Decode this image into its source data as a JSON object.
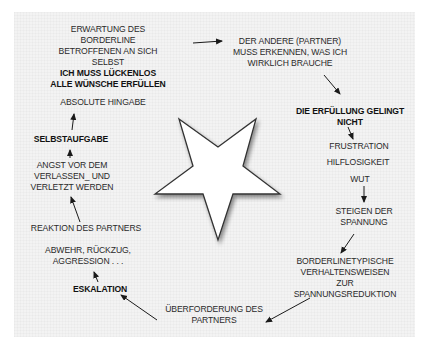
{
  "diagram": {
    "type": "cycle",
    "center_shape": "inverted-star",
    "colors": {
      "background": "#f3f3f3",
      "text": "#2a2a2a",
      "star_fill": "#ffffff",
      "star_stroke": "#333333"
    },
    "nodes": {
      "expectation": {
        "lines": [
          "ERWARTUNG DES",
          "BORDERLINE",
          "BETROFFENEN AN SICH",
          "SELBST"
        ],
        "bold_lines": [
          "ICH MUSS LÜCKENLOS",
          "ALLE WÜNSCHE ERFÜLLEN"
        ]
      },
      "hingabe": {
        "text": "ABSOLUTE HINGABE"
      },
      "partner_must": {
        "lines": [
          "DER ANDERE (PARTNER)",
          "MUSS ERKENNEN, WAS ICH",
          "WIRKLICH BRAUCHE"
        ]
      },
      "fulfillment_fails": {
        "lines": [
          "DIE ERFÜLLUNG GELINGT",
          "NICHT"
        ]
      },
      "frustration": {
        "text": "FRUSTRATION"
      },
      "hilflosigkeit": {
        "text": "HILFLOSIGKEIT"
      },
      "wut": {
        "text": "WUT"
      },
      "tension_rise": {
        "lines": [
          "STEIGEN DER",
          "SPANNUNG"
        ]
      },
      "borderline_behaviour": {
        "lines": [
          "BORDERLINETYPISCHE",
          "VERHALTENSWEISEN",
          "ZUR",
          "SPANNUNGSREDUKTION"
        ]
      },
      "overload": {
        "lines": [
          "ÜBERFORDERUNG DES",
          "PARTNERS"
        ]
      },
      "eskalation": {
        "text": "ESKALATION"
      },
      "abwehr": {
        "lines": [
          "ABWEHR, RÜCKZUG,",
          "AGGRESSION . . ."
        ]
      },
      "reaktion": {
        "text": "REAKTION DES PARTNERS"
      },
      "angst": {
        "lines": [
          "ANGST VOR DEM",
          "VERLASSEN_ UND",
          "VERLETZT WERDEN"
        ]
      },
      "selbstaufgabe": {
        "text": "SELBSTAUFGABE"
      }
    }
  }
}
